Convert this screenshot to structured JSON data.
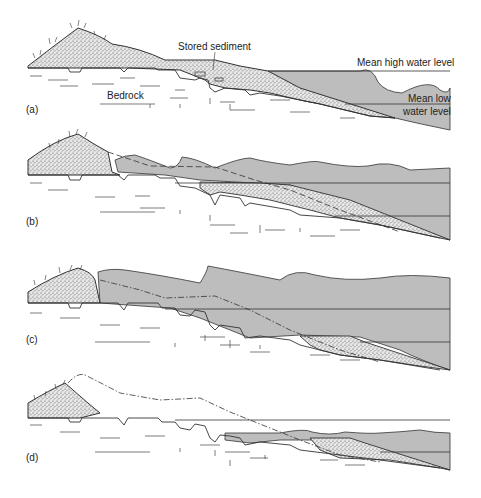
{
  "figure": {
    "panels": [
      {
        "id": "a",
        "label": "(a)"
      },
      {
        "id": "b",
        "label": "(b)"
      },
      {
        "id": "c",
        "label": "(c)"
      },
      {
        "id": "d",
        "label": "(d)"
      }
    ],
    "annotations": {
      "stored_sediment": "Stored sediment",
      "bedrock": "Bedrock",
      "mean_high_water": "Mean high water level",
      "mean_low_water_1": "Mean low",
      "mean_low_water_2": "water level"
    },
    "colors": {
      "water": "#bdbdbd",
      "sediment": "#d4d4d4",
      "line": "#333333",
      "background": "#ffffff"
    }
  }
}
